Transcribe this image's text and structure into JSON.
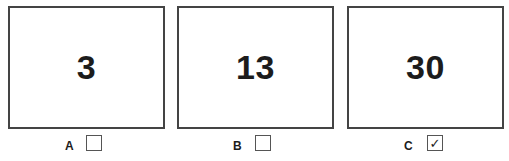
{
  "options": [
    {
      "label": "A",
      "value": "3",
      "checked": false,
      "check_glyph": ""
    },
    {
      "label": "B",
      "value": "13",
      "checked": false,
      "check_glyph": ""
    },
    {
      "label": "C",
      "value": "30",
      "checked": true,
      "check_glyph": "✓"
    }
  ],
  "colors": {
    "border": "#444444",
    "text": "#1c1c1c",
    "background": "#ffffff"
  }
}
